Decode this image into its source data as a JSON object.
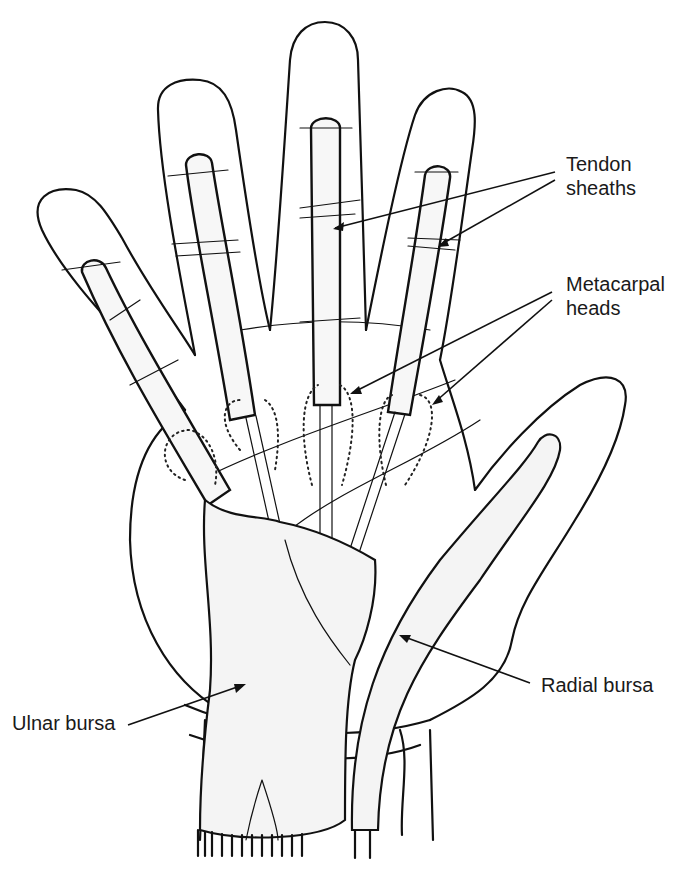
{
  "figure": {
    "type": "anatomical-illustration",
    "style": "black-and-white line drawing with hatching"
  },
  "labels": {
    "tendon_sheaths": {
      "line1": "Tendon",
      "line2": "sheaths"
    },
    "metacarpal_heads": {
      "line1": "Metacarpal",
      "line2": "heads"
    },
    "ulnar_bursa": {
      "text": "Ulnar bursa"
    },
    "radial_bursa": {
      "text": "Radial bursa"
    }
  },
  "colors": {
    "ink": "#111111",
    "background": "#ffffff",
    "label_text": "#1a1a1a"
  }
}
